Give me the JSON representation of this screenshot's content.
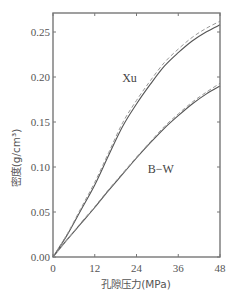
{
  "chart_data": {
    "type": "line",
    "title": "",
    "xlabel": "孔隙压力(MPa)",
    "ylabel": "密度(g/cm³)",
    "xlim": [
      0,
      48
    ],
    "ylim": [
      0,
      0.27
    ],
    "xticks": [
      0,
      12,
      24,
      36,
      48
    ],
    "xtick_labels": [
      "0",
      "12",
      "24",
      "36",
      "48"
    ],
    "yticks": [
      0.0,
      0.05,
      0.1,
      0.15,
      0.2,
      0.25
    ],
    "ytick_labels": [
      "0.00",
      "0.05",
      "0.10",
      "0.15",
      "0.20",
      "0.25"
    ],
    "grid": false,
    "legend": null,
    "annotations": [
      {
        "text": "Xu",
        "x": 22,
        "y": 0.195
      },
      {
        "text": "B−W",
        "x": 31,
        "y": 0.093
      }
    ],
    "series": [
      {
        "name": "Xu (solid)",
        "style": "solid",
        "x": [
          0,
          4,
          8,
          12,
          16,
          20,
          24,
          28,
          32,
          36,
          40,
          44,
          48
        ],
        "y": [
          0,
          0.024,
          0.052,
          0.08,
          0.113,
          0.145,
          0.17,
          0.192,
          0.212,
          0.227,
          0.24,
          0.25,
          0.258
        ]
      },
      {
        "name": "Xu (dashed)",
        "style": "dashed",
        "x": [
          0,
          4,
          8,
          12,
          16,
          20,
          24,
          28,
          32,
          36,
          40,
          44,
          48
        ],
        "y": [
          0,
          0.025,
          0.054,
          0.083,
          0.116,
          0.149,
          0.174,
          0.196,
          0.216,
          0.231,
          0.244,
          0.254,
          0.262
        ]
      },
      {
        "name": "B-W (solid)",
        "style": "solid",
        "x": [
          0,
          4,
          8,
          12,
          16,
          20,
          24,
          28,
          32,
          36,
          40,
          44,
          48
        ],
        "y": [
          0,
          0.019,
          0.037,
          0.055,
          0.074,
          0.092,
          0.11,
          0.127,
          0.143,
          0.157,
          0.17,
          0.181,
          0.19
        ]
      },
      {
        "name": "B-W (dashed)",
        "style": "dashed",
        "x": [
          0,
          4,
          8,
          12,
          16,
          20,
          24,
          28,
          32,
          36,
          40,
          44,
          48
        ],
        "y": [
          0,
          0.019,
          0.038,
          0.056,
          0.075,
          0.093,
          0.111,
          0.128,
          0.145,
          0.159,
          0.172,
          0.183,
          0.193
        ]
      }
    ]
  },
  "colors": {
    "axis": "#777777",
    "line": "#555555",
    "dashed": "#999999"
  }
}
